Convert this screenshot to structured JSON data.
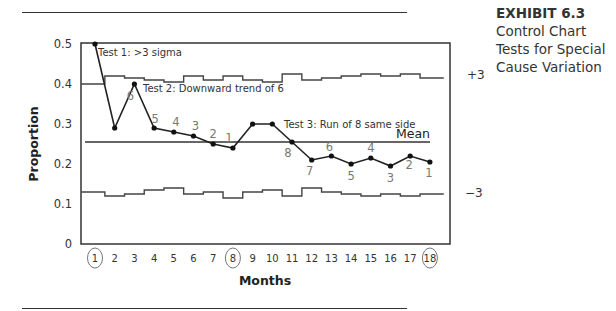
{
  "exhibit": {
    "number": "EXHIBIT 6.3",
    "title_lines": [
      "Control Chart",
      "Tests for Special",
      "Cause Variation"
    ]
  },
  "chart_data": {
    "type": "line",
    "title": "Control Chart Tests for Special Cause Variation",
    "xlabel": "Months",
    "ylabel": "Proportion",
    "x": [
      1,
      2,
      3,
      4,
      5,
      6,
      7,
      8,
      9,
      10,
      11,
      12,
      13,
      14,
      15,
      16,
      17,
      18
    ],
    "ylim": [
      0,
      0.5
    ],
    "yticks": [
      "0",
      "0.1",
      "0.2",
      "0.3",
      "0.4",
      "0.5"
    ],
    "circled_x": [
      1,
      8,
      18
    ],
    "series": [
      {
        "name": "Proportion",
        "values": [
          0.5,
          0.29,
          0.4,
          0.29,
          0.28,
          0.27,
          0.25,
          0.24,
          0.3,
          0.3,
          0.255,
          0.21,
          0.22,
          0.2,
          0.215,
          0.195,
          0.22,
          0.205
        ]
      },
      {
        "name": "Upper control limit (+3)",
        "values": [
          0.4,
          0.42,
          0.415,
          0.41,
          0.405,
          0.42,
          0.41,
          0.42,
          0.41,
          0.405,
          0.425,
          0.41,
          0.415,
          0.42,
          0.425,
          0.42,
          0.425,
          0.415
        ]
      },
      {
        "name": "Mean",
        "values": [
          0.255,
          0.255,
          0.255,
          0.255,
          0.255,
          0.255,
          0.255,
          0.255,
          0.255,
          0.255,
          0.255,
          0.255,
          0.255,
          0.255,
          0.255,
          0.255,
          0.255,
          0.255
        ]
      },
      {
        "name": "Lower control limit (-3)",
        "values": [
          0.13,
          0.12,
          0.125,
          0.135,
          0.14,
          0.125,
          0.13,
          0.115,
          0.13,
          0.135,
          0.12,
          0.14,
          0.13,
          0.125,
          0.12,
          0.125,
          0.12,
          0.125
        ]
      }
    ],
    "limit_labels": {
      "upper": "+3",
      "lower": "−3",
      "mean": "Mean"
    },
    "annotations": [
      {
        "text": "Test 1:  >3 sigma",
        "x": 1,
        "y": 0.5
      },
      {
        "text": "Test 2: Downward trend of 6",
        "x": 3,
        "y": 0.4
      },
      {
        "text": "Test 3: Run of 8 same side",
        "x": 11,
        "y": 0.3
      }
    ],
    "point_labels": [
      {
        "x": 3,
        "label": "6"
      },
      {
        "x": 4,
        "label": "5"
      },
      {
        "x": 5,
        "label": "4"
      },
      {
        "x": 6,
        "label": "3"
      },
      {
        "x": 7,
        "label": "2"
      },
      {
        "x": 8,
        "label": "1"
      },
      {
        "x": 11,
        "label": "8"
      },
      {
        "x": 12,
        "label": "7"
      },
      {
        "x": 13,
        "label": "6"
      },
      {
        "x": 14,
        "label": "5"
      },
      {
        "x": 15,
        "label": "4"
      },
      {
        "x": 16,
        "label": "3"
      },
      {
        "x": 17,
        "label": "2"
      },
      {
        "x": 18,
        "label": "1"
      }
    ],
    "grid": false,
    "legend": "none"
  }
}
